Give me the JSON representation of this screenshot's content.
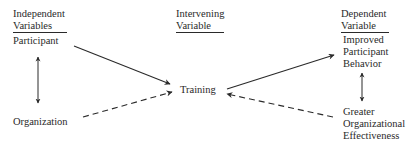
{
  "diagram": {
    "columns": {
      "independent": {
        "header_line1": "Independent",
        "header_line2": "Variables",
        "items": [
          "Participant",
          "Organization"
        ]
      },
      "intervening": {
        "header_line1": "Intervening",
        "header_line2": "Variable",
        "items": [
          "Training"
        ]
      },
      "dependent": {
        "header_line1": "Dependent",
        "header_line2": "Variable",
        "items": [
          {
            "line1": "Improved",
            "line2": "Participant",
            "line3": "Behavior"
          },
          {
            "line1": "Greater",
            "line2": "Organizational",
            "line3": "Effectiveness"
          }
        ]
      }
    },
    "edges": [
      {
        "from": "Participant",
        "to": "Training",
        "style": "solid"
      },
      {
        "from": "Organization",
        "to": "Training",
        "style": "dashed"
      },
      {
        "from": "Training",
        "to": "Improved Participant Behavior",
        "style": "solid"
      },
      {
        "from": "Greater Organizational Effectiveness",
        "to": "Training",
        "style": "dashed"
      },
      {
        "from": "Participant",
        "to": "Organization",
        "style": "solid",
        "bidirectional": true
      },
      {
        "from": "Improved Participant Behavior",
        "to": "Greater Organizational Effectiveness",
        "style": "solid",
        "bidirectional": true
      }
    ],
    "colors": {
      "ink": "#2a2a2a",
      "background": "#ffffff"
    }
  }
}
